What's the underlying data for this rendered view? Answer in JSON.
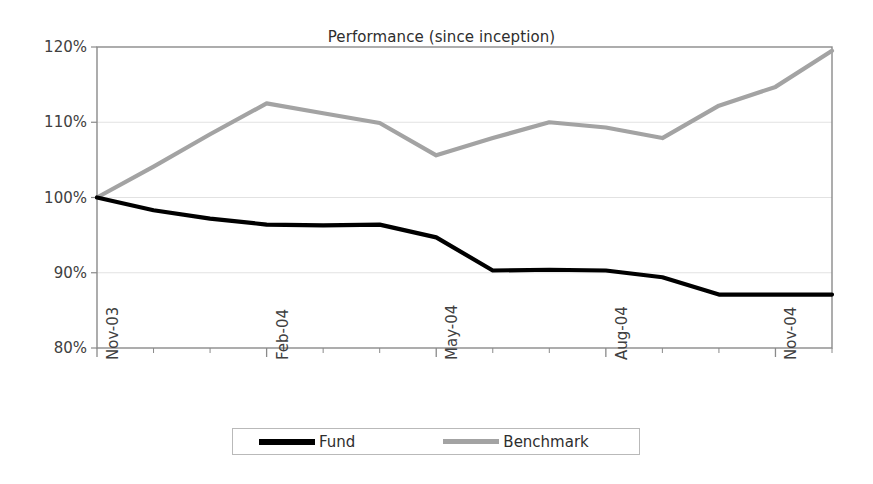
{
  "chart_data": {
    "type": "line",
    "title": "Performance (since inception)",
    "xlabel": "",
    "ylabel": "",
    "ylim": [
      80,
      120
    ],
    "ytick_labels": [
      "120%",
      "110%",
      "100%",
      "90%",
      "80%"
    ],
    "ytick_values": [
      120,
      110,
      100,
      90,
      80
    ],
    "grid": true,
    "legend_position": "bottom",
    "x": [
      "Nov-03",
      "Dec-03",
      "Jan-04",
      "Feb-04",
      "Mar-04",
      "Apr-04",
      "May-04",
      "Jun-04",
      "Jul-04",
      "Aug-04",
      "Sep-04",
      "Oct-04",
      "Nov-04",
      "Dec-04"
    ],
    "xtick_labels": [
      "Nov-03",
      "Feb-04",
      "May-04",
      "Aug-04",
      "Nov-04"
    ],
    "xtick_indices": [
      0,
      3,
      6,
      9,
      12
    ],
    "series": [
      {
        "name": "Fund",
        "color": "#000000",
        "values": [
          100.0,
          98.3,
          97.2,
          96.4,
          96.3,
          96.4,
          94.7,
          90.3,
          90.4,
          90.3,
          89.4,
          87.1,
          87.1,
          87.1
        ]
      },
      {
        "name": "Benchmark",
        "color": "#a3a3a3",
        "values": [
          100.0,
          104.1,
          108.4,
          112.5,
          111.2,
          109.9,
          105.6,
          107.9,
          110.0,
          109.3,
          107.9,
          112.2,
          114.7,
          116.6
        ]
      }
    ],
    "benchmark_final": 119.5
  },
  "legend": {
    "fund_label": "Fund",
    "benchmark_label": "Benchmark"
  }
}
